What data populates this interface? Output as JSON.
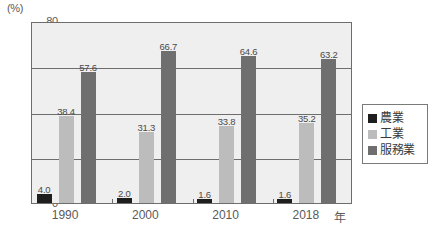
{
  "chart_data": {
    "type": "bar",
    "title": "",
    "subtitle": "",
    "xlabel": "年",
    "ylabel": "(%)",
    "ylim": [
      0,
      80
    ],
    "ytick_values": [
      0,
      20,
      40,
      60,
      80
    ],
    "ytick_labels": [
      "0",
      "20",
      "40",
      "60",
      "80"
    ],
    "grid": true,
    "grid_axis": "y",
    "legend_position": "right-outside",
    "categories": [
      "1990",
      "2000",
      "2010",
      "2018"
    ],
    "series": [
      {
        "name": "農業",
        "color": "#1e1e1e",
        "values": [
          4.0,
          2.0,
          1.6,
          1.6
        ],
        "labels": [
          "4.0",
          "2.0",
          "1.6",
          "1.6"
        ]
      },
      {
        "name": "工業",
        "color": "#bcbcbc",
        "values": [
          38.4,
          31.3,
          33.8,
          35.2
        ],
        "labels": [
          "38.4",
          "31.3",
          "33.8",
          "35.2"
        ]
      },
      {
        "name": "服務業",
        "color": "#6f6f6f",
        "values": [
          57.6,
          66.7,
          64.6,
          63.2
        ],
        "labels": [
          "57.6",
          "66.7",
          "64.6",
          "63.2"
        ]
      }
    ]
  },
  "axis": {
    "unit_label": "(%)",
    "x_axis_unit": "年"
  },
  "legend": {
    "entries": [
      {
        "label": "農業",
        "color": "#1e1e1e"
      },
      {
        "label": "工業",
        "color": "#bcbcbc"
      },
      {
        "label": "服務業",
        "color": "#6f6f6f"
      }
    ]
  },
  "colors": {
    "plot_background": "#efefef",
    "page_background": "#ffffff",
    "axis_line": "#6d6d6d",
    "text": "#5a5a5a"
  }
}
